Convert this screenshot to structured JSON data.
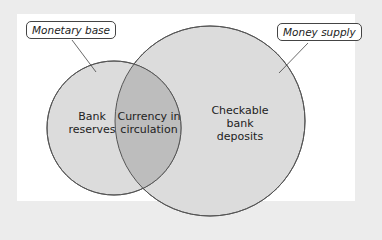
{
  "diagram": {
    "type": "venn",
    "colors": {
      "background": "#ececec",
      "panel": "#ffffff",
      "circle_fill": "#dcdcdc",
      "overlap_fill": "#bdbdbd",
      "stroke": "#555555"
    },
    "callouts": {
      "monetary_base": "Monetary base",
      "money_supply": "Money supply"
    },
    "regions": {
      "bank_reserves_line1": "Bank",
      "bank_reserves_line2": "reserves",
      "currency_line1": "Currency in",
      "currency_line2": "circulation",
      "checkable_line1": "Checkable",
      "checkable_line2": "bank",
      "checkable_line3": "deposits"
    }
  }
}
